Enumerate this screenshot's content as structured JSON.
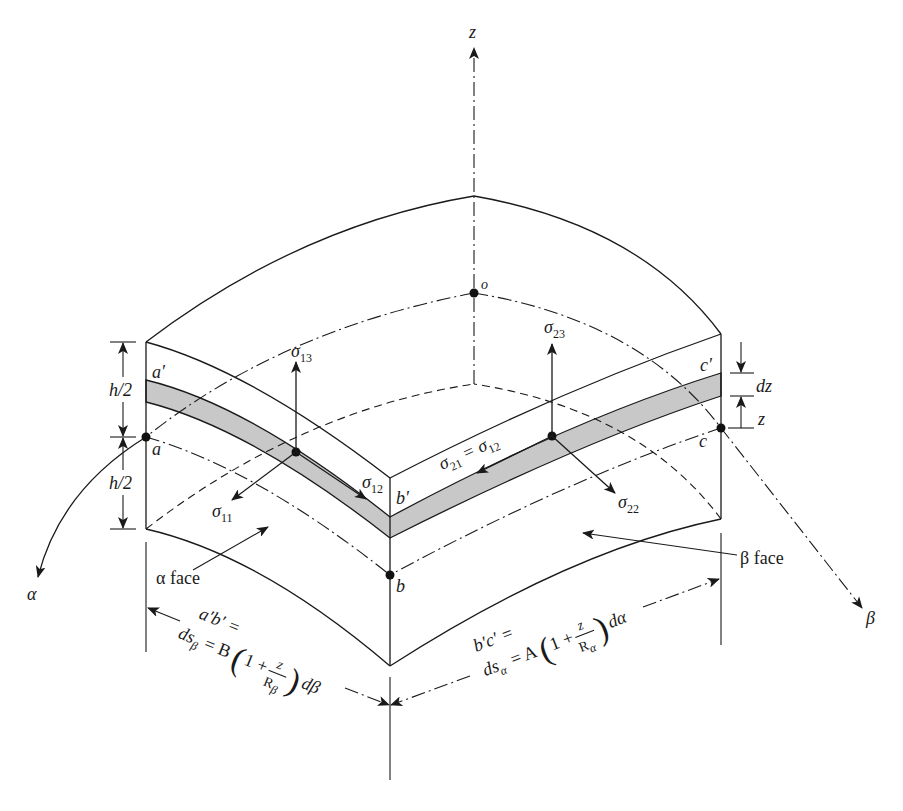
{
  "figure": {
    "colors": {
      "stroke": "#1a1a1a",
      "band_fill": "#c8c8c8",
      "background": "#ffffff"
    },
    "axes": {
      "z": "z",
      "alpha": "α",
      "beta": "β",
      "origin": "o"
    },
    "points": {
      "a_prime": "a′",
      "a": "a",
      "b_prime": "b′",
      "b": "b",
      "c_prime": "c′",
      "c": "c"
    },
    "dimensions": {
      "h_half_top": "h/2",
      "h_half_bottom": "h/2",
      "dz": "dz",
      "z": "z"
    },
    "stresses": {
      "sigma13": {
        "symbol": "σ",
        "sub": "13"
      },
      "sigma11": {
        "symbol": "σ",
        "sub": "11"
      },
      "sigma12": {
        "symbol": "σ",
        "sub": "12"
      },
      "sigma23": {
        "symbol": "σ",
        "sub": "23"
      },
      "sigma22": {
        "symbol": "σ",
        "sub": "22"
      },
      "sigma21": {
        "symbol": "σ",
        "sub": "21",
        "eq": " = ",
        "symbol2": "σ",
        "sub2": "12"
      }
    },
    "face_labels": {
      "alpha_face": "α face",
      "beta_face": "β face"
    },
    "arc_lengths": {
      "left": {
        "line1": "a′b′ =",
        "ds": "ds",
        "ds_sub": "β",
        "eq": "= B",
        "open": "(",
        "one_plus": "1 +",
        "num": "z",
        "den": "R",
        "den_sub": "β",
        "close": ")",
        "tail": "dβ"
      },
      "right": {
        "line1": "b′c′ =",
        "ds": "ds",
        "ds_sub": "α",
        "eq": "= A",
        "open": "(",
        "one_plus": "1 +",
        "num": "z",
        "den": "R",
        "den_sub": "α",
        "close": ")",
        "tail": "dα"
      }
    }
  }
}
